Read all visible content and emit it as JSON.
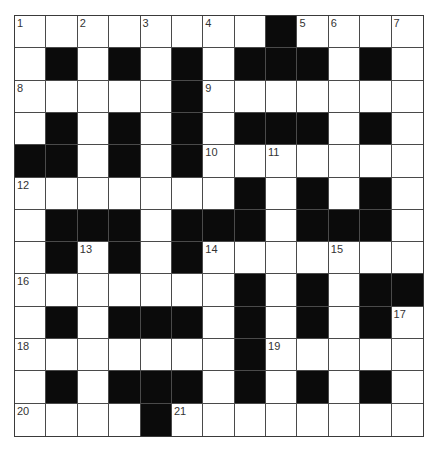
{
  "puzzle": {
    "rows": 13,
    "cols": 13,
    "colors": {
      "black_cell": "#0b0b0b",
      "white_cell": "#ffffff",
      "grid_line": "#4a4a4a",
      "number_text": "#333333"
    },
    "layout": [
      "....#.......#....",
      "placeholder"
    ],
    "grid": [
      [
        "1",
        "",
        "2",
        "",
        "3",
        "",
        "4",
        "",
        "#",
        "5",
        "6",
        "",
        "7"
      ],
      [
        "",
        "#",
        "",
        "#",
        "",
        "#",
        "",
        "#",
        "#",
        "#",
        "",
        "#",
        ""
      ],
      [
        "8",
        "",
        "",
        "",
        "",
        "#",
        "9",
        "",
        "",
        "",
        "",
        "",
        ""
      ],
      [
        "",
        "#",
        "",
        "#",
        "",
        "#",
        "",
        "#",
        "#",
        "#",
        "",
        "#",
        ""
      ],
      [
        "#",
        "#",
        "",
        "#",
        "",
        "#",
        "10",
        "",
        "11",
        "",
        "",
        "",
        ""
      ],
      [
        "12",
        "",
        "",
        "",
        "",
        "",
        "",
        "#",
        "",
        "#",
        "",
        "#",
        ""
      ],
      [
        "",
        "#",
        "#",
        "#",
        "",
        "#",
        "#",
        "#",
        "",
        "#",
        "#",
        "#",
        ""
      ],
      [
        "",
        "#",
        "13",
        "#",
        "",
        "#",
        "14",
        "",
        "",
        "",
        "15",
        "",
        ""
      ],
      [
        "16",
        "",
        "",
        "",
        "",
        "",
        "",
        "#",
        "",
        "#",
        "",
        "#",
        "#"
      ],
      [
        "",
        "#",
        "",
        "#",
        "#",
        "#",
        "",
        "#",
        "",
        "#",
        "",
        "#",
        "17"
      ],
      [
        "18",
        "",
        "",
        "",
        "",
        "",
        "",
        "#",
        "19",
        "",
        "",
        "",
        ""
      ],
      [
        "",
        "#",
        "",
        "#",
        "#",
        "#",
        "",
        "#",
        "",
        "#",
        "",
        "#",
        ""
      ],
      [
        "20",
        "",
        "",
        "",
        "#",
        "21",
        "",
        "",
        "",
        "",
        "",
        "",
        ""
      ]
    ]
  }
}
